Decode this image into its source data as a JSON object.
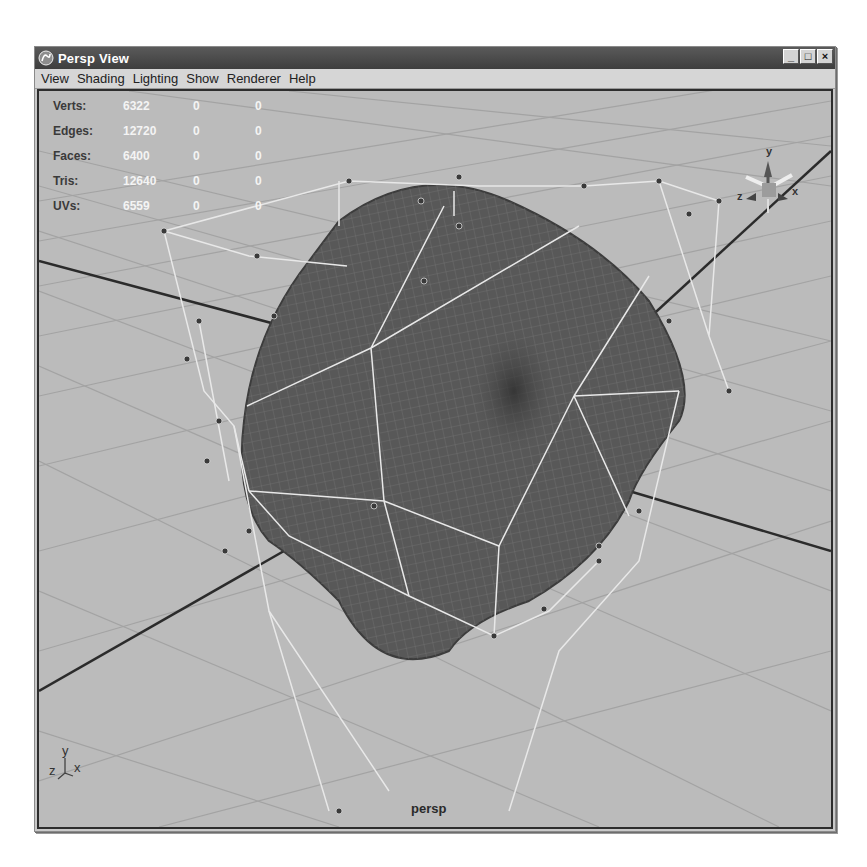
{
  "window": {
    "title": "Persp View",
    "controls": {
      "minimize": "_",
      "maximize": "□",
      "close": "×"
    }
  },
  "menubar": {
    "items": [
      {
        "label": "View"
      },
      {
        "label": "Shading"
      },
      {
        "label": "Lighting"
      },
      {
        "label": "Show"
      },
      {
        "label": "Renderer"
      },
      {
        "label": "Help"
      }
    ]
  },
  "hud": {
    "rows": [
      {
        "label": "Verts:",
        "values": [
          "6322",
          "0",
          "0"
        ]
      },
      {
        "label": "Edges:",
        "values": [
          "12720",
          "0",
          "0"
        ]
      },
      {
        "label": "Faces:",
        "values": [
          "6400",
          "0",
          "0"
        ]
      },
      {
        "label": "Tris:",
        "values": [
          "12640",
          "0",
          "0"
        ]
      },
      {
        "label": "UVs:",
        "values": [
          "6559",
          "0",
          "0"
        ]
      }
    ]
  },
  "viewport": {
    "camera_label": "persp",
    "axis_indicator": {
      "y": "y",
      "z": "z",
      "x": "x"
    },
    "viewcube": {
      "y": "y",
      "z": "z",
      "x": "x"
    }
  },
  "colors": {
    "titlebar": "#4a4a4a",
    "menubar": "#d6d6d6",
    "viewport_bg": "#b9b9b9",
    "grid": "#a4a4a4",
    "mesh": "#5a5a5a",
    "cage": "#e6e6e6"
  }
}
